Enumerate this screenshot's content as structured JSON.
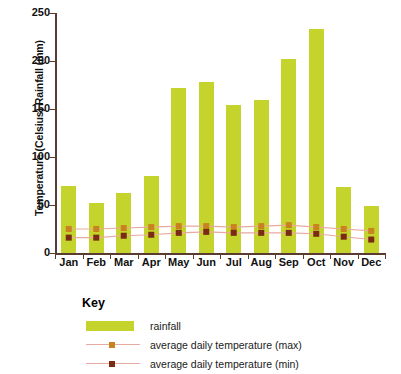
{
  "chart_data": {
    "type": "bar",
    "title": "",
    "xlabel": "",
    "ylabel": "Temperature (Celsius) Rainfall (mm)",
    "ylim": [
      0,
      250
    ],
    "yticks": [
      0,
      50,
      100,
      150,
      200,
      250
    ],
    "grid": false,
    "legend_position": "below-left",
    "categories": [
      "Jan",
      "Feb",
      "Mar",
      "Apr",
      "May",
      "Jun",
      "Jul",
      "Aug",
      "Sep",
      "Oct",
      "Nov",
      "Dec"
    ],
    "series": [
      {
        "name": "rainfall",
        "type": "bar",
        "unit": "mm",
        "color": "#c4d42d",
        "values": [
          70,
          52,
          63,
          80,
          172,
          178,
          154,
          159,
          202,
          233,
          69,
          49
        ]
      },
      {
        "name": "average daily temperature (max)",
        "type": "line",
        "unit": "Celsius",
        "color": "#c8821e",
        "line_color": "#e8a9a0",
        "values": [
          25,
          25,
          26,
          27,
          28,
          28,
          27,
          28,
          29,
          27,
          25,
          23
        ]
      },
      {
        "name": "average daily temperature (min)",
        "type": "line",
        "unit": "Celsius",
        "color": "#7a2b14",
        "line_color": "#e8a9a0",
        "values": [
          16,
          16,
          18,
          19,
          21,
          22,
          21,
          21,
          21,
          20,
          17,
          14
        ]
      }
    ]
  },
  "axis": {
    "y_title": "Temperature (Celsius) Rainfall (mm)",
    "tick_labels": [
      "250",
      "200",
      "150",
      "100",
      "50",
      "0"
    ],
    "month_labels": [
      "Jan",
      "Feb",
      "Mar",
      "Apr",
      "May",
      "Jun",
      "Jul",
      "Aug",
      "Sep",
      "Oct",
      "Nov",
      "Dec"
    ]
  },
  "key": {
    "title": "Key",
    "items": [
      {
        "label": "rainfall",
        "swatch": "bar-swatch",
        "color": "#c4d42d"
      },
      {
        "label": "average daily temperature (max)",
        "swatch": "line-marker-swatch",
        "color": "#c8821e"
      },
      {
        "label": "average daily temperature (min)",
        "swatch": "line-marker-swatch",
        "color": "#7a2b14"
      }
    ]
  }
}
